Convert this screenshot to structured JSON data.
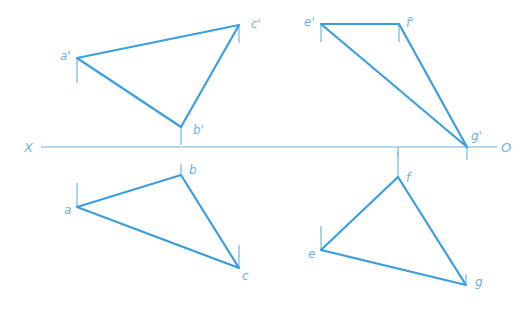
{
  "axis": {
    "left_label": "X",
    "right_label": "O",
    "y": 147,
    "x_start": 41,
    "x_end": 497
  },
  "colors": {
    "edge": "#3a9ee0",
    "tick": "#5fb0e6",
    "axis": "#5fb6e8",
    "label": "#6cb3e3"
  },
  "triangles": [
    {
      "name": "abc-front-view",
      "points": [
        {
          "label": "a'",
          "x": 77,
          "y": 58
        },
        {
          "label": "b'",
          "x": 181,
          "y": 127
        },
        {
          "label": "c'",
          "x": 239,
          "y": 25
        }
      ]
    },
    {
      "name": "efg-front-view",
      "points": [
        {
          "label": "e'",
          "x": 321,
          "y": 24
        },
        {
          "label": "f'",
          "x": 399,
          "y": 24
        },
        {
          "label": "g'",
          "x": 467,
          "y": 147
        }
      ]
    },
    {
      "name": "abc-top-view",
      "points": [
        {
          "label": "a",
          "x": 77,
          "y": 207
        },
        {
          "label": "b",
          "x": 181,
          "y": 175
        },
        {
          "label": "c",
          "x": 239,
          "y": 268
        }
      ]
    },
    {
      "name": "efg-top-view",
      "points": [
        {
          "label": "e",
          "x": 321,
          "y": 250
        },
        {
          "label": "f",
          "x": 398,
          "y": 177
        },
        {
          "label": "g",
          "x": 466,
          "y": 285
        }
      ]
    }
  ],
  "labels": {
    "a_prime": "a'",
    "b_prime": "b'",
    "c_prime": "c'",
    "e_prime": "e'",
    "f_prime": "f'",
    "g_prime": "g'",
    "a": "a",
    "b": "b",
    "c": "c",
    "e": "e",
    "f": "f",
    "g": "g"
  }
}
